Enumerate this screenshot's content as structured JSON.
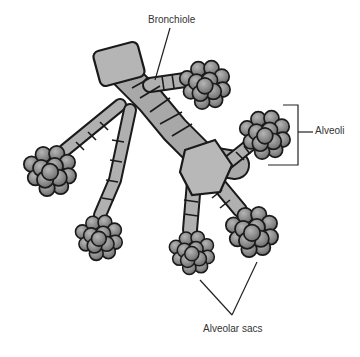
{
  "diagram": {
    "labels": {
      "bronchiole": "Bronchiole",
      "alveoli": "Alveoli",
      "alveolar_sacs": "Alveolar sacs"
    },
    "colors": {
      "outline": "#1a1a1a",
      "tube_fill": "#a8a8a8",
      "tube_light": "#c8c8c8",
      "sac_fill": "#8a8a8a",
      "sac_light": "#a0a0a0",
      "leader_line": "#222222"
    }
  }
}
